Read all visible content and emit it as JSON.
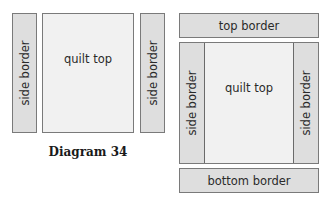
{
  "diagram_left": {
    "side_border_left": "side border",
    "quilt_top": "quilt top",
    "side_border_right": "side border",
    "caption": "Diagram 34"
  },
  "diagram_right": {
    "top_border": "top border",
    "side_border_left": "side border",
    "quilt_top": "quilt top",
    "side_border_right": "side border",
    "bottom_border": "bottom border"
  },
  "colors": {
    "border_fill": "#dedede",
    "quilt_top_fill": "#f1f1f1",
    "outline": "#7a7a7a"
  }
}
